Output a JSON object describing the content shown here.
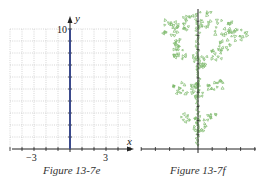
{
  "chart_data": [
    {
      "type": "line",
      "title": "",
      "caption": "Figure 13-7e",
      "xlabel": "x",
      "ylabel": "y",
      "x_ticks_labeled": [
        -3,
        3
      ],
      "y_ticks_labeled": [
        10
      ],
      "xlim": [
        -5,
        5
      ],
      "ylim": [
        0,
        10
      ],
      "grid": true,
      "series": [
        {
          "name": "vertical segment",
          "x": [
            0,
            0
          ],
          "y": [
            0,
            10
          ],
          "color": "#3b4a8c"
        }
      ]
    },
    {
      "type": "scatter",
      "title": "",
      "caption": "Figure 13-7f",
      "xlabel": "",
      "ylabel": "",
      "grid": false,
      "description": "Fractal tree (iterated function system) growing upward along the y-axis, green points",
      "series": [
        {
          "name": "fractal",
          "color": "#7fba6e"
        }
      ]
    }
  ],
  "figures": {
    "left": {
      "caption": "Figure 13-7e",
      "x_label": "x",
      "y_label": "y",
      "tick_neg3": "−3",
      "tick_pos3": "3",
      "tick_10": "10",
      "line_color": "#3b4a8c",
      "grid_color": "#b5b5b5"
    },
    "right": {
      "caption": "Figure 13-7f",
      "fractal_color": "#7fba6e"
    }
  }
}
